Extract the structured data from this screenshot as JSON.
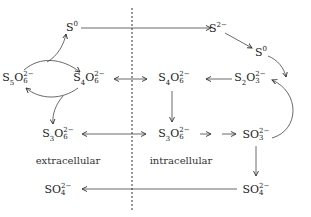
{
  "diagram": {
    "type": "sulfur-compound-pathway",
    "regions": {
      "extracellular": "extracellular",
      "intracellular": "intracellular"
    },
    "nodes": {
      "s0_left": {
        "base": "S",
        "sub": "",
        "sup": "0"
      },
      "s5o6": {
        "base": "S5O6",
        "html": "S<sub>5</sub>O",
        "sub": "6",
        "sup": "2−"
      },
      "s4o6_ext": {
        "base": "S4O6",
        "sub": "6",
        "sup": "2−"
      },
      "s3o6_ext": {
        "base": "S3O6",
        "sub": "6",
        "sup": "2−"
      },
      "so4_ext": {
        "base": "SO4",
        "sub": "4",
        "sup": "2−"
      },
      "s2_minus": {
        "base": "S",
        "sup": "2−"
      },
      "s0_right": {
        "base": "S",
        "sup": "0"
      },
      "s4o6_int": {
        "base": "S4O6",
        "sub": "6",
        "sup": "2−"
      },
      "s2o3": {
        "base": "S2O3",
        "sub": "3",
        "sup": "2−"
      },
      "s3o6_int": {
        "base": "S3O6",
        "sub": "6",
        "sup": "2−"
      },
      "so3": {
        "base": "SO3",
        "sub": "3",
        "sup": "2−"
      },
      "so4_int": {
        "base": "SO4",
        "sub": "4",
        "sup": "2−"
      }
    },
    "labels": {
      "s0_left": "S",
      "s0_left_sup": "0",
      "s2_minus": "S",
      "s2_minus_sup": "2−",
      "s0_right": "S",
      "s0_right_sup": "0"
    }
  }
}
